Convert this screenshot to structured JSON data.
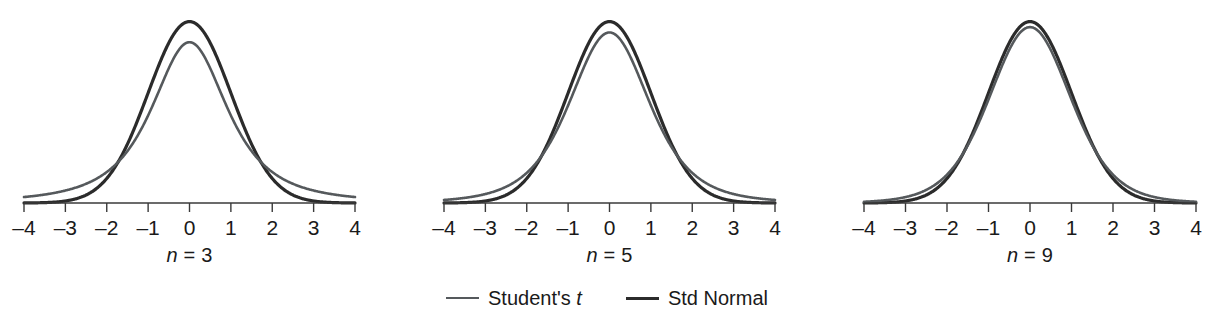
{
  "figure": {
    "background": "#ffffff",
    "width": 1214,
    "height": 320
  },
  "chart_data": {
    "type": "line",
    "title": "",
    "subtitle": "",
    "xlabel": "",
    "ylabel": "",
    "grid": false,
    "legend_position": "bottom-center",
    "xlim": [
      -4,
      4
    ],
    "xticks": [
      -4,
      -3,
      -2,
      -1,
      0,
      1,
      2,
      3,
      4
    ],
    "xtick_labels": [
      "–4",
      "–3",
      "–2",
      "–1",
      "0",
      "1",
      "2",
      "3",
      "4"
    ],
    "yaxis_visible": false,
    "ylim": [
      0,
      0.42
    ],
    "series_definitions": [
      {
        "name": "Student's t",
        "color": "#55595c",
        "line_width": 2.6,
        "distribution": "students-t"
      },
      {
        "name": "Std Normal",
        "color": "#2b2b2b",
        "line_width": 3.2,
        "distribution": "standard-normal"
      }
    ],
    "panels": [
      {
        "caption_prefix": "n",
        "caption_equals": "=",
        "caption_value": "3",
        "n": 3,
        "df": 2,
        "peak_t": 0.354,
        "peak_normal": 0.399,
        "series": [
          {
            "name": "Student's t",
            "x": [
              -4,
              -3.5,
              -3,
              -2.5,
              -2,
              -1.5,
              -1,
              -0.5,
              0,
              0.5,
              1,
              1.5,
              2,
              2.5,
              3,
              3.5,
              4
            ],
            "y": [
              0.0199,
              0.0275,
              0.0403,
              0.0626,
              0.1021,
              0.1658,
              0.2523,
              0.328,
              0.3536,
              0.328,
              0.2523,
              0.1658,
              0.1021,
              0.0626,
              0.0403,
              0.0275,
              0.0199
            ]
          },
          {
            "name": "Std Normal",
            "x": [
              -4,
              -3.5,
              -3,
              -2.5,
              -2,
              -1.5,
              -1,
              -0.5,
              0,
              0.5,
              1,
              1.5,
              2,
              2.5,
              3,
              3.5,
              4
            ],
            "y": [
              0.0001,
              0.0009,
              0.0044,
              0.0175,
              0.054,
              0.1295,
              0.242,
              0.3521,
              0.3989,
              0.3521,
              0.242,
              0.1295,
              0.054,
              0.0175,
              0.0044,
              0.0009,
              0.0001
            ]
          }
        ]
      },
      {
        "caption_prefix": "n",
        "caption_equals": "=",
        "caption_value": "5",
        "n": 5,
        "df": 4,
        "peak_t": 0.375,
        "peak_normal": 0.399,
        "series": [
          {
            "name": "Student's t",
            "x": [
              -4,
              -3.5,
              -3,
              -2.5,
              -2,
              -1.5,
              -1,
              -0.5,
              0,
              0.5,
              1,
              1.5,
              2,
              2.5,
              3,
              3.5,
              4
            ],
            "y": [
              0.0051,
              0.0084,
              0.0145,
              0.0264,
              0.051,
              0.1009,
              0.1933,
              0.3178,
              0.375,
              0.3178,
              0.1933,
              0.1009,
              0.051,
              0.0264,
              0.0145,
              0.0084,
              0.0051
            ]
          },
          {
            "name": "Std Normal",
            "x": [
              -4,
              -3.5,
              -3,
              -2.5,
              -2,
              -1.5,
              -1,
              -0.5,
              0,
              0.5,
              1,
              1.5,
              2,
              2.5,
              3,
              3.5,
              4
            ],
            "y": [
              0.0001,
              0.0009,
              0.0044,
              0.0175,
              0.054,
              0.1295,
              0.242,
              0.3521,
              0.3989,
              0.3521,
              0.242,
              0.1295,
              0.054,
              0.0175,
              0.0044,
              0.0009,
              0.0001
            ]
          }
        ]
      },
      {
        "caption_prefix": "n",
        "caption_equals": "=",
        "caption_value": "9",
        "n": 9,
        "df": 8,
        "peak_t": 0.387,
        "peak_normal": 0.399,
        "series": [
          {
            "name": "Student's t",
            "x": [
              -4,
              -3.5,
              -3,
              -2.5,
              -2,
              -1.5,
              -1,
              -0.5,
              0,
              0.5,
              1,
              1.5,
              2,
              2.5,
              3,
              3.5,
              4
            ],
            "y": [
              0.0013,
              0.0026,
              0.0058,
              0.0136,
              0.0331,
              0.0822,
              0.191,
              0.3311,
              0.3867,
              0.3311,
              0.191,
              0.0822,
              0.0331,
              0.0136,
              0.0058,
              0.0026,
              0.0013
            ]
          },
          {
            "name": "Std Normal",
            "x": [
              -4,
              -3.5,
              -3,
              -2.5,
              -2,
              -1.5,
              -1,
              -0.5,
              0,
              0.5,
              1,
              1.5,
              2,
              2.5,
              3,
              3.5,
              4
            ],
            "y": [
              0.0001,
              0.0009,
              0.0044,
              0.0175,
              0.054,
              0.1295,
              0.242,
              0.3521,
              0.3989,
              0.3521,
              0.242,
              0.1295,
              0.054,
              0.0175,
              0.0044,
              0.0009,
              0.0001
            ]
          }
        ]
      }
    ],
    "legend": [
      {
        "label_main": "Student's",
        "label_italic": "t",
        "color": "#55595c",
        "line_width": 2.6
      },
      {
        "label_main": "Std Normal",
        "label_italic": "",
        "color": "#2b2b2b",
        "line_width": 3.2
      }
    ]
  },
  "axis_style": {
    "color": "#3a3a3a",
    "line_width": 1.4,
    "tick_length": 9
  },
  "panel_geometry": [
    {
      "left": 0,
      "axis_x0": 24,
      "axis_x1": 355,
      "baseline_y": 203,
      "plot_top": 12
    },
    {
      "left": 420,
      "axis_x0": 24,
      "axis_x1": 355,
      "baseline_y": 203,
      "plot_top": 12
    },
    {
      "left": 840,
      "axis_x0": 24,
      "axis_x1": 356,
      "baseline_y": 203,
      "plot_top": 12
    }
  ]
}
